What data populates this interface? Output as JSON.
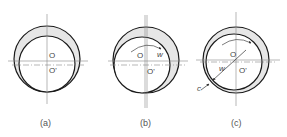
{
  "figures": [
    {
      "id": "a",
      "caption": "(a)",
      "center_label": "O",
      "shaft_center_label": "O'",
      "outer": {
        "cx": 47,
        "cy": 59,
        "r": 33
      },
      "inner": {
        "cx": 47,
        "cy": 64,
        "r": 28
      }
    },
    {
      "id": "b",
      "caption": "(b)",
      "center_label": "O",
      "shaft_center_label": "O'",
      "rotation_label": "w",
      "outer": {
        "cx": 146,
        "cy": 60,
        "r": 33
      },
      "inner": {
        "cx": 142,
        "cy": 65,
        "r": 28
      }
    },
    {
      "id": "c",
      "caption": "(c)",
      "center_label": "O",
      "shaft_center_label": "O'",
      "rotation_label": "w",
      "clearance_label": "c",
      "outer": {
        "cx": 236,
        "cy": 60,
        "r": 33
      },
      "inner": {
        "cx": 232,
        "cy": 62,
        "r": 28
      }
    }
  ],
  "colors": {
    "stroke": "#1a1a1a",
    "axis": "#777777",
    "fill_gap": "#e6e6e6",
    "text": "#444444"
  }
}
